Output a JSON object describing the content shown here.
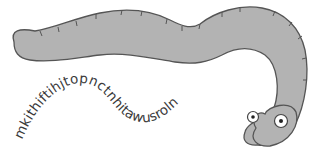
{
  "illustration": {
    "subject": "worm",
    "body_color": "#b3b3b3",
    "outline_color": "#555555",
    "eye_white": "#ffffff",
    "pupil_color": "#222222"
  },
  "curved_text": {
    "text": "mkithiftihjtopnctnhitawusroln",
    "color": "#3a3a3a"
  }
}
